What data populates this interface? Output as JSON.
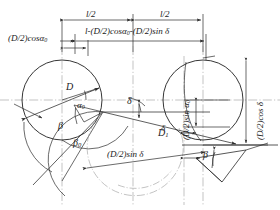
{
  "figure": {
    "background_color": "#ffffff",
    "line_color": "#2b2b2b",
    "centerline_color": "#9a9a9a"
  },
  "dimensions": {
    "top_row": [
      {
        "id": "half-length-left",
        "label": "l/2"
      },
      {
        "id": "half-length-right",
        "label": "l/2"
      }
    ],
    "second_row": {
      "id": "effective-length",
      "label": "l-(D/2)cosα",
      "label_sub_1": "0",
      "label_tail": "-(D/2)sin δ",
      "full": "l-(D/2)cosα0-(D/2)sin δ"
    },
    "left_label": {
      "id": "left-offset",
      "label": "(D/2)cosα",
      "label_sub": "0",
      "full": "(D/2)cosα0"
    },
    "right_vertical_inner": {
      "id": "right-inner-height",
      "label": "(D/2)sin α",
      "label_sub": "0",
      "full": "(D/2)sin α0"
    },
    "right_vertical_outer": {
      "id": "right-outer-height",
      "label": "(D/2)cos δ",
      "full": "(D/2)cos δ"
    },
    "bottom": {
      "id": "bottom-offset",
      "label": "(D/2)sin δ",
      "full": "(D/2)sin δ"
    }
  },
  "labels": {
    "diameter": "D",
    "link_length": "D",
    "link_length_sub": "1",
    "link_length_full": "D1",
    "alpha0": "α",
    "alpha0_sub": "0",
    "beta": "β",
    "beta0": "β",
    "beta0_sub": "0",
    "delta": "δ",
    "beta_right": "β"
  },
  "geometry": {
    "left_circle": {
      "cx": 62,
      "cy": 100,
      "r": 40
    },
    "right_circle": {
      "cx": 203,
      "cy": 100,
      "r": 40
    },
    "centerline_y": 100,
    "left_center_vertical_x": 62,
    "mid_vertical_x": 133,
    "right_center_vertical_x": 203
  }
}
